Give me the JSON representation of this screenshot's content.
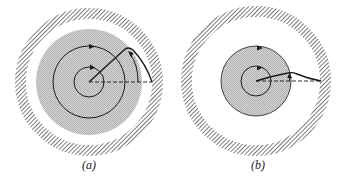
{
  "figure": {
    "panels": [
      {
        "id": "a",
        "label": "(a)",
        "description": "Wide shaded core with two circular orbits; trajectory arcs upward and down to the outer wall",
        "orbits": 2,
        "orbit_direction": "counterclockwise",
        "shaded_region": "large core",
        "trajectory": "rises to a peak then curves down to the wall"
      },
      {
        "id": "b",
        "label": "(b)",
        "description": "Smaller shaded core with two orbits; trajectory nearly flat, slightly rising then falling to the wall",
        "orbits": 2,
        "orbit_direction": "counterclockwise",
        "shaded_region": "small core",
        "trajectory": "shallow rise then descends to the wall"
      }
    ],
    "colors": {
      "line": "#1a1a1a",
      "shade": "#c8c8c8",
      "hatch": "#6e6e6e",
      "background": "#ffffff"
    }
  }
}
